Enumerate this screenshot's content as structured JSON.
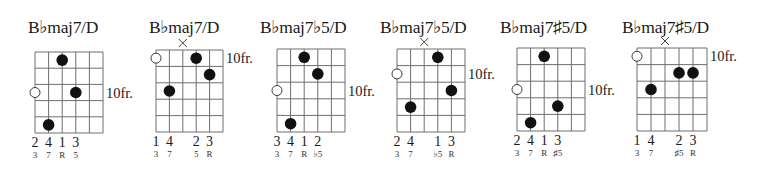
{
  "chords": [
    {
      "title": "B♭maj7/D",
      "fret_label": "10fr.",
      "fret_label_row": 3,
      "open_strings": [
        {
          "string": 1,
          "fret_row": 3
        }
      ],
      "muted_strings": [],
      "dots": [
        {
          "string": 3,
          "fret_row": 1
        },
        {
          "string": 4,
          "fret_row": 3
        },
        {
          "string": 2,
          "fret_row": 5
        }
      ],
      "fingering": [
        "2",
        "4",
        "1",
        "3",
        "",
        ""
      ],
      "intervals": [
        "3",
        "7",
        "R",
        "5",
        "",
        ""
      ]
    },
    {
      "title": "B♭maj7/D",
      "fret_label": "10fr.",
      "fret_label_row": 1,
      "open_strings": [
        {
          "string": 1,
          "fret_row": 1
        }
      ],
      "muted_strings": [
        3
      ],
      "dots": [
        {
          "string": 4,
          "fret_row": 1
        },
        {
          "string": 5,
          "fret_row": 2
        },
        {
          "string": 2,
          "fret_row": 3
        }
      ],
      "fingering": [
        "1",
        "4",
        "",
        "2",
        "3",
        ""
      ],
      "intervals": [
        "3",
        "7",
        "",
        "5",
        "R",
        ""
      ]
    },
    {
      "title": "B♭maj7♭5/D",
      "fret_label": "10fr.",
      "fret_label_row": 3,
      "open_strings": [
        {
          "string": 1,
          "fret_row": 3
        }
      ],
      "muted_strings": [],
      "dots": [
        {
          "string": 3,
          "fret_row": 1
        },
        {
          "string": 4,
          "fret_row": 2
        },
        {
          "string": 2,
          "fret_row": 5
        }
      ],
      "fingering": [
        "3",
        "4",
        "1",
        "2",
        "",
        ""
      ],
      "intervals": [
        "3",
        "7",
        "R",
        "♭5",
        "",
        ""
      ]
    },
    {
      "title": "B♭maj7♭5/D",
      "fret_label": "10fr.",
      "fret_label_row": 2,
      "open_strings": [
        {
          "string": 1,
          "fret_row": 2
        }
      ],
      "muted_strings": [
        3
      ],
      "dots": [
        {
          "string": 4,
          "fret_row": 1
        },
        {
          "string": 5,
          "fret_row": 3
        },
        {
          "string": 2,
          "fret_row": 4
        }
      ],
      "fingering": [
        "2",
        "4",
        "",
        "1",
        "3",
        ""
      ],
      "intervals": [
        "3",
        "7",
        "",
        "♭5",
        "R",
        ""
      ]
    },
    {
      "title": "B♭maj7♯5/D",
      "fret_label": "10fr.",
      "fret_label_row": 3,
      "open_strings": [
        {
          "string": 1,
          "fret_row": 3
        }
      ],
      "muted_strings": [],
      "dots": [
        {
          "string": 3,
          "fret_row": 1
        },
        {
          "string": 4,
          "fret_row": 4
        },
        {
          "string": 2,
          "fret_row": 5
        }
      ],
      "fingering": [
        "2",
        "4",
        "1",
        "3",
        "",
        ""
      ],
      "intervals": [
        "3",
        "7",
        "R",
        "♯5",
        "",
        ""
      ]
    },
    {
      "title": "B♭maj7♯5/D",
      "fret_label": "10fr.",
      "fret_label_row": 1,
      "open_strings": [
        {
          "string": 1,
          "fret_row": 1
        }
      ],
      "muted_strings": [
        3
      ],
      "dots": [
        {
          "string": 4,
          "fret_row": 2
        },
        {
          "string": 5,
          "fret_row": 2
        },
        {
          "string": 2,
          "fret_row": 3
        }
      ],
      "fingering": [
        "1",
        "4",
        "",
        "2",
        "3",
        ""
      ],
      "intervals": [
        "3",
        "7",
        "",
        "♯5",
        "R",
        ""
      ]
    }
  ],
  "grid": {
    "strings": 6,
    "frets": 5
  }
}
